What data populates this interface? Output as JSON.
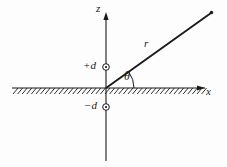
{
  "figure": {
    "background_color": "#fdfdfd",
    "stroke_color": "#1a1a1a",
    "axes": {
      "vertical": {
        "label": "z",
        "x": 106,
        "top": 14,
        "bottom": 161,
        "arrow": "up"
      },
      "horizontal": {
        "label": "x",
        "y": 88,
        "left": 12,
        "right": 205,
        "arrow": "right"
      }
    },
    "origin": {
      "x": 106,
      "y": 88
    },
    "ray": {
      "label": "r",
      "from_x": 106,
      "from_y": 88,
      "to_x": 212,
      "to_y": 12,
      "angle_degrees": 35,
      "endpoint_marker": "dot"
    },
    "angle": {
      "label": "θ",
      "arc_radius": 26,
      "start_degrees": 0,
      "end_degrees": 35
    },
    "markers": [
      {
        "label": "+d",
        "icon": "circle-charge-icon",
        "x": 106,
        "y": 67,
        "radius": 3.2
      },
      {
        "label": "−d",
        "icon": "circle-charge-icon",
        "x": 106,
        "y": 107,
        "radius": 3.2
      }
    ],
    "ground": {
      "name": "hatched-ground-surface",
      "line_y": 88,
      "left": 12,
      "right": 205,
      "hatch_count": 42,
      "hatch_length": 7,
      "hatch_angle_degrees": 55
    }
  }
}
